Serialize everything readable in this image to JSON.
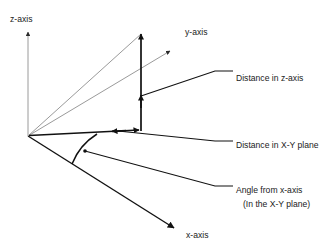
{
  "diagram": {
    "background_color": "#ffffff",
    "axis_color": "#111111",
    "construction_line_color": "#9a9a9a",
    "measure_line_color": "#111111",
    "text_color": "#1a1a1a",
    "origin": {
      "x": 28,
      "y": 136
    },
    "axes": [
      {
        "id": "z-axis",
        "label": "z-axis",
        "label_x": 10,
        "label_y": 20,
        "from": {
          "x": 28,
          "y": 136
        },
        "to": {
          "x": 28,
          "y": 30
        },
        "style": "construction"
      },
      {
        "id": "y-axis",
        "label": "y-axis",
        "label_x": 185,
        "label_y": 33,
        "from": {
          "x": 28,
          "y": 136
        },
        "to": {
          "x": 172,
          "y": 50
        },
        "style": "construction"
      },
      {
        "id": "x-axis",
        "label": "x-axis",
        "label_x": 185,
        "label_y": 236,
        "from": {
          "x": 28,
          "y": 136
        },
        "to": {
          "x": 176,
          "y": 229
        },
        "style": "axis"
      }
    ],
    "construction_lines": [
      {
        "id": "hypotenuse-to-point",
        "from": {
          "x": 28,
          "y": 136
        },
        "to": {
          "x": 141,
          "y": 33
        }
      }
    ],
    "measures": [
      {
        "id": "distance-z-axis",
        "label": "Distance in z-axis",
        "label_x": 236,
        "label_y": 81,
        "from": {
          "x": 141,
          "y": 130
        },
        "to": {
          "x": 141,
          "y": 33
        },
        "leader_from": {
          "x": 141,
          "y": 96
        },
        "leader_mid": {
          "x": 215,
          "y": 71
        },
        "leader_to": {
          "x": 232,
          "y": 71
        }
      },
      {
        "id": "distance-xy-plane",
        "label": "Distance in X-Y plane",
        "label_x": 236,
        "label_y": 148,
        "from": {
          "x": 28,
          "y": 136
        },
        "to": {
          "x": 141,
          "y": 130
        },
        "leader_from": {
          "x": 118,
          "y": 131
        },
        "leader_mid": {
          "x": 215,
          "y": 141
        },
        "leader_to": {
          "x": 232,
          "y": 141
        }
      },
      {
        "id": "angle-from-x-axis",
        "label_line1": "Angle from x-axis",
        "label_line2": "(In the X-Y plane)",
        "label_x": 236,
        "label_y1": 193,
        "label_y2": 207,
        "arc_start": {
          "x": 97,
          "y": 134
        },
        "arc_end": {
          "x": 72,
          "y": 164
        },
        "arc_radius": 58,
        "leader_from": {
          "x": 85,
          "y": 151
        },
        "leader_mid": {
          "x": 215,
          "y": 186
        },
        "leader_to": {
          "x": 232,
          "y": 186
        }
      }
    ]
  }
}
